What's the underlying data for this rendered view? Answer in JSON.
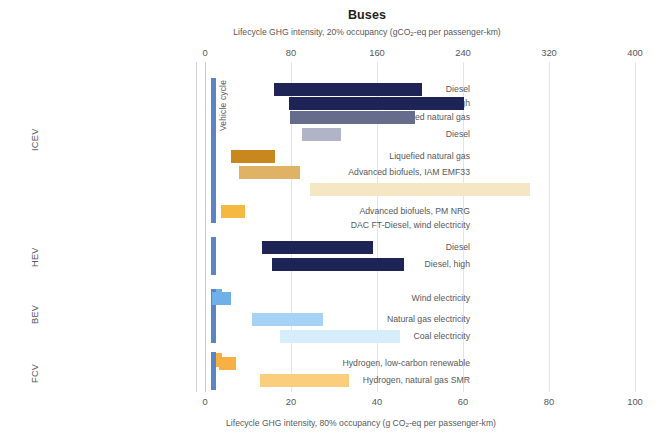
{
  "header": {
    "title": "Buses",
    "subtitle_pre": "Lifecycle GHG intensity, 20% occupancy (gCO",
    "subtitle_sub": "2",
    "subtitle_post": "-eq per passenger-km)",
    "bottom_caption_pre": "Lifecycle GHG intensity, 80% occupancy (g CO",
    "bottom_caption_sub": "2",
    "bottom_caption_post": "-eq per passenger-km)"
  },
  "vehicle_cycle_label": "Vehicle cycle",
  "chart_data": {
    "type": "bar",
    "orientation": "horizontal",
    "title": "Buses",
    "subtitle": "Lifecycle GHG intensity, 20% occupancy (gCO2-eq per passenger-km)",
    "xlabel_top": "Lifecycle GHG intensity, 20% occupancy (gCO2-eq per passenger-km)",
    "xlabel_bottom": "Lifecycle GHG intensity, 80% occupancy (g CO2-eq per passenger-km)",
    "xlim_top": [
      0,
      400
    ],
    "xlim_bottom": [
      0,
      100
    ],
    "xticks_top": [
      0,
      80,
      160,
      240,
      320,
      400
    ],
    "xticks_bottom": [
      0,
      20,
      40,
      60,
      80,
      100
    ],
    "grid": "vertical",
    "legend": "none",
    "note": "Each bar is a floating range (low to high) on the 20%-occupancy top scale; the bottom scale is the same data at 80% occupancy (exactly 1/4 of the top values).",
    "groups": [
      {
        "name": "ICEV",
        "rows": [
          {
            "label": "Diesel",
            "low": 64,
            "high": 202,
            "color": "#1f2456"
          },
          {
            "label": "Diesel, high",
            "low": 78,
            "high": 240,
            "color": "#1f2456"
          },
          {
            "label": "Compressed natural gas",
            "low": 79,
            "high": 195,
            "color": "#666c8c"
          },
          {
            "label": "Diesel",
            "low": 90,
            "high": 126,
            "color": "#b0b4c6"
          },
          {
            "label": "Liquefied natural gas",
            "low": 24,
            "high": 65,
            "color": "#c8881e"
          },
          {
            "label": "Advanced biofuels, IAM EMF33",
            "low": 32,
            "high": 88,
            "color": "#e0b265"
          },
          {
            "label": "Advanced biofuels, PM CLC",
            "low": 98,
            "high": 303,
            "color": "#f5e6c4"
          },
          {
            "label": "Advanced biofuels, PM NRG",
            "low": 15,
            "high": 37,
            "color": "#f5b942"
          },
          {
            "label": "DAC FT-Diesel, wind electricity",
            "low": 0,
            "high": 0,
            "color": "#f5b942"
          }
        ]
      },
      {
        "name": "HEV",
        "rows": [
          {
            "label": "Diesel",
            "low": 53,
            "high": 157,
            "color": "#1f2456"
          },
          {
            "label": "Diesel, high",
            "low": 62,
            "high": 185,
            "color": "#1f2456"
          },
          {
            "label": "",
            "low": 0,
            "high": 0,
            "color": "#1f2456"
          }
        ]
      },
      {
        "name": "BEV",
        "rows": [
          {
            "label": "Wind electricity",
            "low": 6,
            "high": 23,
            "color": "#6fb0e8"
          },
          {
            "label": "Natural gas electricity",
            "low": 44,
            "high": 110,
            "color": "#a6d2f5"
          },
          {
            "label": "Coal electricity",
            "low": 70,
            "high": 182,
            "color": "#d6eefc"
          }
        ]
      },
      {
        "name": "FCV",
        "rows": [
          {
            "label": "Hydrogen, low-carbon renewable",
            "low": 13,
            "high": 28,
            "color": "#f7b143"
          },
          {
            "label": "Hydrogen, natural gas SMR",
            "low": 51,
            "high": 133,
            "color": "#fbce7e"
          }
        ]
      }
    ]
  },
  "rows_render": [
    {
      "label": "Diesel",
      "group": "ICEV",
      "x0": 274,
      "x1": 422,
      "y": 83,
      "color": "#1f2456"
    },
    {
      "label": "Diesel, high",
      "group": "ICEV",
      "x0": 289,
      "x1": 464,
      "y": 97,
      "color": "#1f2456"
    },
    {
      "label": "Compressed natural gas",
      "group": "ICEV",
      "x0": 290,
      "x1": 415,
      "y": 111,
      "color": "#666c8c"
    },
    {
      "label": "Diesel",
      "group": "ICEV",
      "x0": 302,
      "x1": 341,
      "y": 128,
      "color": "#b0b4c6"
    },
    {
      "label": "Liquefied natural gas",
      "group": "ICEV",
      "x0": 231,
      "x1": 275,
      "y": 150,
      "color": "#c8881e"
    },
    {
      "label": "Advanced biofuels, IAM EMF33",
      "group": "ICEV",
      "x0": 239,
      "x1": 300,
      "y": 166,
      "color": "#e0b265"
    },
    {
      "label": "Advanced biofuels, PM CLC",
      "group": "ICEV",
      "x0": 310,
      "x1": 530,
      "y": 183,
      "color": "#f5e6c4"
    },
    {
      "label": "Advanced biofuels, PM NRG",
      "group": "ICEV",
      "x0": 221,
      "x1": 245,
      "y": 205,
      "color": "#f5b942"
    },
    {
      "label": "DAC FT-Diesel, wind electricity",
      "group": "ICEV",
      "x0": 0,
      "x1": 0,
      "y": 219,
      "color": "#f5b942"
    },
    {
      "label": "Diesel",
      "group": "HEV",
      "x0": 262,
      "x1": 373,
      "y": 241,
      "color": "#1f2456"
    },
    {
      "label": "Diesel, high",
      "group": "HEV",
      "x0": 272,
      "x1": 404,
      "y": 258,
      "color": "#1f2456"
    },
    {
      "label": "Wind electricity",
      "group": "BEV",
      "x0": 212,
      "x1": 231,
      "y": 292,
      "color": "#6fb0e8"
    },
    {
      "label": "Natural gas electricity",
      "group": "BEV",
      "x0": 252,
      "x1": 323,
      "y": 313,
      "color": "#a6d2f5"
    },
    {
      "label": "Coal electricity",
      "group": "BEV",
      "x0": 280,
      "x1": 400,
      "y": 330,
      "color": "#d6eefc"
    },
    {
      "label": "Hydrogen, low-carbon renewable",
      "group": "FCV",
      "x0": 219,
      "x1": 236,
      "y": 357,
      "color": "#f7b143"
    },
    {
      "label": "Hydrogen, natural gas SMR",
      "group": "FCV",
      "x0": 260,
      "x1": 349,
      "y": 374,
      "color": "#fbce7e"
    }
  ],
  "group_labels": [
    {
      "name": "ICEV",
      "top": 100,
      "height": 80
    },
    {
      "name": "HEV",
      "top": 237,
      "height": 40
    },
    {
      "name": "BEV",
      "top": 293,
      "height": 42
    },
    {
      "name": "FCV",
      "top": 353,
      "height": 40
    }
  ],
  "axis_top": {
    "ticks": [
      "0",
      "80",
      "160",
      "240",
      "320",
      "400"
    ],
    "px": [
      205,
      291,
      377,
      463,
      549,
      635
    ]
  },
  "axis_bottom": {
    "ticks": [
      "0",
      "20",
      "40",
      "60",
      "80",
      "100"
    ],
    "px": [
      205,
      291,
      377,
      463,
      549,
      635
    ]
  }
}
